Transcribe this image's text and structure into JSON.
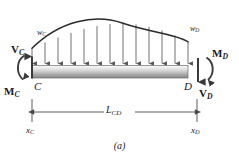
{
  "figure": {
    "caption": "(a)",
    "beam": {
      "left_point_label": "C",
      "right_point_label": "D",
      "fill_top": "#f2f2f2",
      "fill_bottom": "#8c8c8c",
      "outline": "#6b6b6b"
    },
    "loads": {
      "left_intensity_label": "w",
      "left_intensity_sub": "C",
      "right_intensity_label": "w",
      "right_intensity_sub": "D",
      "arrow_count": 13,
      "curve_color": "#2b2b2b",
      "arrow_color": "#585858"
    },
    "reactions": {
      "shear_left_label": "V",
      "shear_left_sub": "C",
      "shear_right_label": "V",
      "shear_right_sub": "D",
      "moment_left_label": "M",
      "moment_left_sub": "C",
      "moment_right_label": "M",
      "moment_right_sub": "D",
      "arrow_color": "#3a3a3a"
    },
    "dimension": {
      "length_label": "L",
      "length_sub": "CD",
      "left_station_label": "x",
      "left_station_sub": "C",
      "right_station_label": "x",
      "right_station_sub": "D",
      "line_color": "#4a4a4a"
    }
  }
}
